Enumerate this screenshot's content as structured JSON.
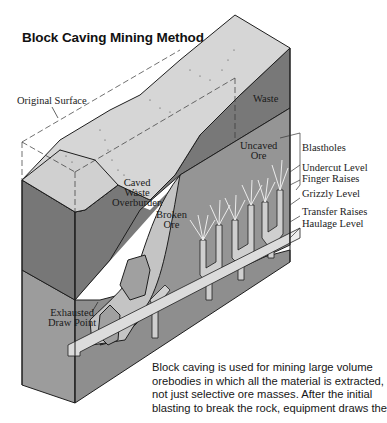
{
  "title": "Block Caving Mining Method",
  "labels": {
    "original_surface": "Original Surface",
    "waste": "Waste",
    "caved_waste_overburden": [
      "Caved",
      "Waste",
      "Overburden"
    ],
    "broken_ore": [
      "Broken",
      "Ore"
    ],
    "uncaved_ore": [
      "Uncaved",
      "Ore"
    ],
    "exhausted_draw_point": [
      "Exhausted",
      "Draw Point"
    ]
  },
  "levels": [
    "Blastholes",
    "Undercut Level",
    "Finger Raises",
    "Grizzly Level",
    "Transfer Raises",
    "Haulage Level"
  ],
  "caption": [
    "Block caving is used for mining large volume",
    "orebodies in which all the material is extracted,",
    "not just selective ore masses. After the initial",
    "blasting to break the rock, equipment draws the"
  ],
  "colors": {
    "surface": "#d4d4d4",
    "waste": "#7a7a7a",
    "ore": "#9a9a9a",
    "broken_ore": "#c2c2c2",
    "outline": "#1e1e1e"
  }
}
